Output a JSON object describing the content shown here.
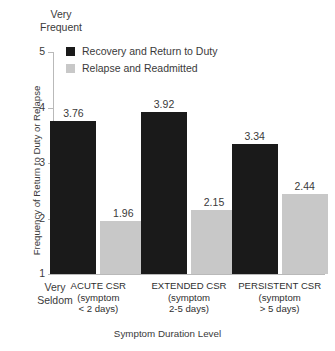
{
  "chart_data": {
    "type": "bar",
    "title": "",
    "xlabel": "Symptom Duration Level",
    "ylabel": "Frequency of Return to Duty or Relapse",
    "ylim": [
      1,
      5
    ],
    "yticks": [
      "1",
      "2",
      "3",
      "4",
      "5"
    ],
    "y_axis_top_cap": "Very\nFrequent",
    "y_axis_bottom_cap": "Very\nSeldom",
    "grid": false,
    "legend_position": "top-left-inside",
    "categories": [
      "ACUTE CSR\n(symptom\n< 2 days)",
      "EXTENDED CSR\n(symptom\n2-5 days)",
      "PERSISTENT CSR\n(symptom\n> 5 days)"
    ],
    "series": [
      {
        "name": "Recovery and Return to Duty",
        "color": "#1a1a1a",
        "values": [
          3.76,
          3.92,
          3.34
        ],
        "labels": [
          "3.76",
          "3.92",
          "3.34"
        ]
      },
      {
        "name": "Relapse and Readmitted",
        "color": "#c8c8c8",
        "values": [
          1.96,
          2.15,
          2.44
        ],
        "labels": [
          "1.96",
          "2.15",
          "2.44"
        ]
      }
    ]
  }
}
